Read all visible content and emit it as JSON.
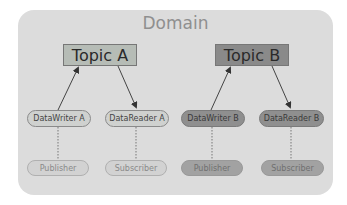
{
  "diagram": {
    "domain": {
      "title": "Domain"
    },
    "topics": [
      {
        "label": "Topic A",
        "color": "#b6bcb6"
      },
      {
        "label": "Topic B",
        "color": "#8a8a8a"
      }
    ],
    "entities": [
      {
        "label": "DataWriter A",
        "topic": "Topic A",
        "role": "writer"
      },
      {
        "label": "DataReader A",
        "topic": "Topic A",
        "role": "reader"
      },
      {
        "label": "DataWriter B",
        "topic": "Topic B",
        "role": "writer"
      },
      {
        "label": "DataReader B",
        "topic": "Topic B",
        "role": "reader"
      }
    ],
    "containers": [
      {
        "label": "Publisher",
        "owns": "DataWriter A"
      },
      {
        "label": "Subscriber",
        "owns": "DataReader A"
      },
      {
        "label": "Publisher",
        "owns": "DataWriter B"
      },
      {
        "label": "Subscriber",
        "owns": "DataReader B"
      }
    ],
    "edges": [
      {
        "from": "DataWriter A",
        "to": "Topic A",
        "style": "arrow"
      },
      {
        "from": "Topic A",
        "to": "DataReader A",
        "style": "arrow"
      },
      {
        "from": "DataWriter B",
        "to": "Topic B",
        "style": "arrow"
      },
      {
        "from": "Topic B",
        "to": "DataReader B",
        "style": "arrow"
      },
      {
        "from": "Publisher",
        "to": "DataWriter A",
        "style": "dotted"
      },
      {
        "from": "Subscriber",
        "to": "DataReader A",
        "style": "dotted"
      },
      {
        "from": "Publisher",
        "to": "DataWriter B",
        "style": "dotted"
      },
      {
        "from": "Subscriber",
        "to": "DataReader B",
        "style": "dotted"
      }
    ]
  }
}
